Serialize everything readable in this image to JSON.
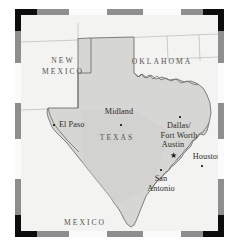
{
  "figure": {
    "name": "texas-state-map",
    "colors": {
      "state_fill": "#d6d6d4",
      "surround_fill": "#f3f3f2",
      "boundary_line": "#6e6b68",
      "frame_dark": "#0d0d0d",
      "frame_gray": "#8e8e8e",
      "frame_light": "#fbfbfb",
      "label_text": "#2e2c2a",
      "state_label_text": "#55524f",
      "page_background": "#ffffff"
    }
  },
  "frame": {
    "style": "segmented-rule",
    "corner_color": "#0d0d0d",
    "segments_top": [
      "black",
      "gray",
      "white",
      "gray",
      "white",
      "gray",
      "black"
    ],
    "segments_bottom": [
      "black",
      "gray",
      "white",
      "gray",
      "white",
      "gray",
      "black"
    ],
    "segments_left": [
      "black",
      "gray",
      "white",
      "gray",
      "white",
      "gray",
      "black"
    ],
    "segments_right": [
      "black",
      "gray",
      "white",
      "gray",
      "white",
      "gray",
      "black"
    ]
  },
  "states": [
    {
      "id": "new-mexico",
      "label": "NEW\nMEXICO",
      "line1": "NEW",
      "line2": "MEXICO",
      "x": 42,
      "y": 45
    },
    {
      "id": "oklahoma",
      "label": "OKLAHOMA",
      "line1": "OKLAHOMA",
      "line2": "",
      "x": 141,
      "y": 45
    },
    {
      "id": "texas",
      "label": "T E X A S",
      "line1": "TEXAS",
      "line2": "",
      "x": 96,
      "y": 122
    },
    {
      "id": "mexico",
      "label": "M E X I C O",
      "line1": "MEXICO",
      "line2": "",
      "x": 64,
      "y": 207
    }
  ],
  "cities": [
    {
      "id": "midland",
      "label": "Midland",
      "line1": "Midland",
      "line2": "",
      "marker": "dot",
      "label_x": 98,
      "label_y": 98,
      "marker_x": 99,
      "marker_y": 110
    },
    {
      "id": "el-paso",
      "label": "El Paso",
      "line1": "El Paso",
      "line2": "",
      "marker": "dot",
      "label_x": 48,
      "label_y": 111,
      "marker_x": 33,
      "marker_y": 113
    },
    {
      "id": "dallas-fort-worth",
      "label": "Dallas/ Fort Worth",
      "line1": "Dallas/",
      "line2": "Fort Worth",
      "marker": "dot",
      "label_x": 158,
      "label_y": 108,
      "marker_x": 159,
      "marker_y": 102
    },
    {
      "id": "austin",
      "label": "Austin",
      "line1": "Austin",
      "line2": "",
      "marker": "star",
      "label_x": 152,
      "label_y": 131,
      "marker_x": 152,
      "marker_y": 142
    },
    {
      "id": "houston",
      "label": "Houston",
      "line1": "Houston",
      "line2": "",
      "marker": "dot",
      "label_x": 186,
      "label_y": 143,
      "marker_x": 186,
      "marker_y": 152
    },
    {
      "id": "san-antonio",
      "label": "San Antonio",
      "line1": "San",
      "line2": "Antonio",
      "marker": "dot",
      "label_x": 140,
      "label_y": 163,
      "marker_x": 140,
      "marker_y": 155
    }
  ],
  "markers_legend": {
    "dot": "city",
    "star": "state capital"
  }
}
